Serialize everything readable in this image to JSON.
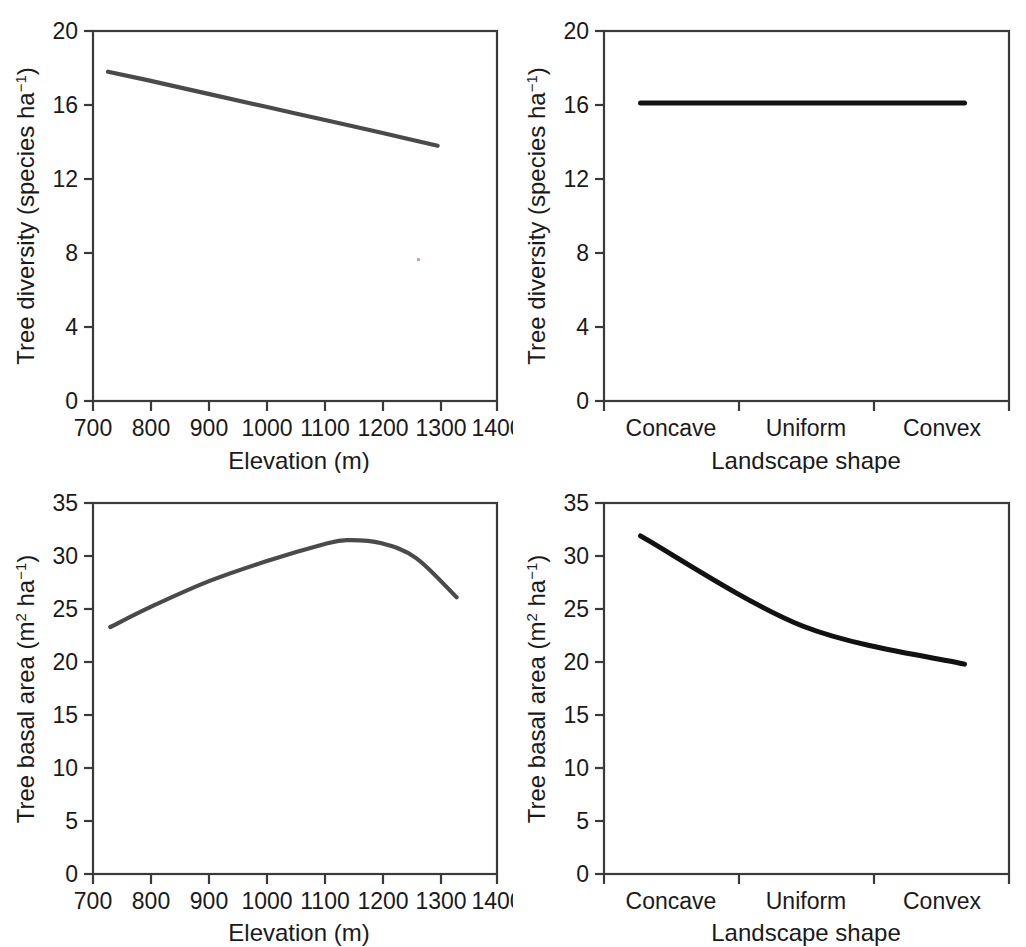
{
  "figure": {
    "title": "",
    "panel_count": 4,
    "background_color": "#ffffff",
    "line_color_light": "#4a4a4a",
    "line_color_dark": "#121212",
    "axis_color": "#3a3a3a"
  },
  "panels": {
    "top_left": {
      "name": "tree-diversity-vs-elevation",
      "xlabel": "Elevation (m)",
      "ylabel_main": "Tree diversity (species ha",
      "ylabel_sup": "−1",
      "ylabel_tail": ")",
      "ylabel_full": "Tree diversity (species ha−1)",
      "xticks": [
        "700",
        "800",
        "900",
        "1000",
        "1100",
        "1200",
        "1300",
        "1400"
      ],
      "yticks": [
        "0",
        "4",
        "8",
        "12",
        "16",
        "20"
      ]
    },
    "top_right": {
      "name": "tree-diversity-vs-landscape-shape",
      "xlabel": "Landscape shape",
      "ylabel_main": "Tree diversity (species ha",
      "ylabel_sup": "−1",
      "ylabel_tail": ")",
      "ylabel_full": "Tree diversity (species ha−1)",
      "xticks": [
        "Concave",
        "Uniform",
        "Convex"
      ],
      "yticks": [
        "0",
        "4",
        "8",
        "12",
        "16",
        "20"
      ]
    },
    "bottom_left": {
      "name": "tree-basal-area-vs-elevation",
      "xlabel": "Elevation (m)",
      "ylabel_pre": "Tree basal area (m",
      "ylabel_sup2": "2",
      "ylabel_mid": " ha",
      "ylabel_sup": "−1",
      "ylabel_tail": ")",
      "ylabel_full": "Tree basal area (m2 ha−1)",
      "xticks": [
        "700",
        "800",
        "900",
        "1000",
        "1100",
        "1200",
        "1300",
        "1400"
      ],
      "yticks": [
        "0",
        "5",
        "10",
        "15",
        "20",
        "25",
        "30",
        "35"
      ]
    },
    "bottom_right": {
      "name": "tree-basal-area-vs-landscape-shape",
      "xlabel": "Landscape shape",
      "ylabel_pre": "Tree basal area (m",
      "ylabel_sup2": "2",
      "ylabel_mid": " ha",
      "ylabel_sup": "−1",
      "ylabel_tail": ")",
      "ylabel_full": "Tree basal area (m2 ha−1)",
      "xticks": [
        "Concave",
        "Uniform",
        "Convex"
      ],
      "yticks": [
        "0",
        "5",
        "10",
        "15",
        "20",
        "25",
        "30",
        "35"
      ]
    }
  },
  "chart_data": [
    {
      "id": "top_left",
      "type": "line",
      "title": "",
      "xlabel": "Elevation (m)",
      "ylabel": "Tree diversity (species ha−1)",
      "xlim": [
        700,
        1400
      ],
      "ylim": [
        0,
        20
      ],
      "xticks": [
        700,
        800,
        900,
        1000,
        1100,
        1200,
        1300,
        1400
      ],
      "yticks": [
        0,
        4,
        8,
        12,
        16,
        20
      ],
      "grid": false,
      "legend": "none",
      "series": [
        {
          "name": "Tree diversity",
          "x": [
            726,
            800,
            900,
            1000,
            1100,
            1200,
            1297
          ],
          "values": [
            17.8,
            17.3,
            16.6,
            15.9,
            15.2,
            14.5,
            13.8
          ]
        }
      ]
    },
    {
      "id": "top_right",
      "type": "line",
      "title": "",
      "xlabel": "Landscape shape",
      "ylabel": "Tree diversity (species ha−1)",
      "categories": [
        "Concave",
        "Uniform",
        "Convex"
      ],
      "ylim": [
        0,
        20
      ],
      "yticks": [
        0,
        4,
        8,
        12,
        16,
        20
      ],
      "grid": false,
      "legend": "none",
      "series": [
        {
          "name": "Tree diversity",
          "values": [
            16.1,
            16.1,
            16.1
          ]
        }
      ]
    },
    {
      "id": "bottom_left",
      "type": "line",
      "title": "",
      "xlabel": "Elevation (m)",
      "ylabel": "Tree basal area (m2 ha−1)",
      "xlim": [
        700,
        1400
      ],
      "ylim": [
        0,
        35
      ],
      "xticks": [
        700,
        800,
        900,
        1000,
        1100,
        1200,
        1300,
        1400
      ],
      "yticks": [
        0,
        5,
        10,
        15,
        20,
        25,
        30,
        35
      ],
      "grid": false,
      "legend": "none",
      "series": [
        {
          "name": "Tree basal area",
          "x": [
            730,
            800,
            900,
            1000,
            1100,
            1140,
            1200,
            1260,
            1330
          ],
          "values": [
            23.3,
            25.2,
            27.6,
            29.5,
            31.1,
            31.5,
            31.2,
            29.8,
            26.1
          ]
        }
      ]
    },
    {
      "id": "bottom_right",
      "type": "line",
      "title": "",
      "xlabel": "Landscape shape",
      "ylabel": "Tree basal area (m2 ha−1)",
      "categories": [
        "Concave",
        "Uniform",
        "Convex"
      ],
      "ylim": [
        0,
        35
      ],
      "yticks": [
        0,
        5,
        10,
        15,
        20,
        25,
        30,
        35
      ],
      "grid": false,
      "legend": "none",
      "series": [
        {
          "name": "Tree basal area",
          "values": [
            31.9,
            23.4,
            19.8
          ]
        }
      ]
    }
  ]
}
